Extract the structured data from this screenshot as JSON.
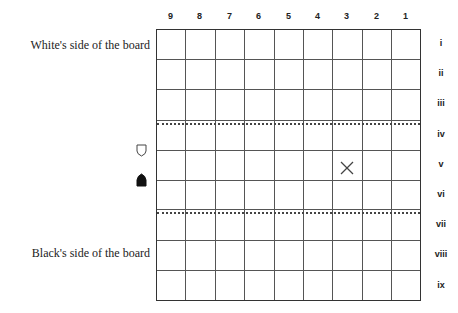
{
  "columns": [
    "9",
    "8",
    "7",
    "6",
    "5",
    "4",
    "3",
    "2",
    "1"
  ],
  "rows": [
    "i",
    "ii",
    "iii",
    "iv",
    "v",
    "vi",
    "vii",
    "viii",
    "ix"
  ],
  "side_labels": {
    "white": "White's side of the board",
    "black": "Black's side of the board"
  },
  "pieces": [
    {
      "name": "white-pawn-icon",
      "color": "white"
    },
    {
      "name": "black-pawn-icon",
      "color": "black"
    }
  ],
  "marked_square": {
    "column": "3",
    "row": "v",
    "symbol": "×"
  },
  "promotion_zone_lines_after_rows": [
    "iii",
    "vi"
  ]
}
